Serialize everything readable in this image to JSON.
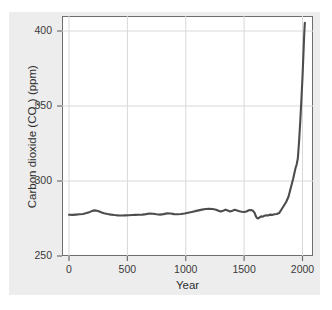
{
  "figure": {
    "cropped_header_text": "",
    "panel_color": "#ededed",
    "plot_background": "#ffffff",
    "frame_color": "#6e6e6e",
    "grid_color": "#d8d8d8",
    "line_color": "#4d4d4d"
  },
  "chart_data": {
    "type": "line",
    "title": "",
    "xlabel": "Year",
    "ylabel": "Carbon dioxide (CO2) (ppm)",
    "ylabel_parts": {
      "pre": "Carbon dioxide (CO",
      "sub": "2",
      "post": ") (ppm)"
    },
    "xlim": [
      -60,
      2090
    ],
    "ylim": [
      250,
      410
    ],
    "xticks": [
      0,
      500,
      1000,
      1500,
      2000
    ],
    "xtick_labels": [
      "0",
      "500",
      "1000",
      "1500",
      "2000"
    ],
    "yticks": [
      250,
      300,
      350,
      400
    ],
    "ytick_labels": [
      "250",
      "300",
      "350",
      "400"
    ],
    "grid": "both-light",
    "legend": "none",
    "series": [
      {
        "name": "Atmospheric CO2 concentration",
        "color": "#4d4d4d",
        "x": [
          0,
          30,
          60,
          90,
          120,
          150,
          180,
          200,
          220,
          240,
          260,
          280,
          300,
          330,
          360,
          390,
          420,
          450,
          480,
          510,
          540,
          570,
          600,
          630,
          660,
          690,
          720,
          750,
          780,
          810,
          840,
          870,
          900,
          930,
          960,
          990,
          1020,
          1050,
          1080,
          1110,
          1140,
          1170,
          1200,
          1230,
          1260,
          1280,
          1300,
          1320,
          1340,
          1360,
          1380,
          1400,
          1420,
          1440,
          1460,
          1480,
          1500,
          1520,
          1540,
          1560,
          1575,
          1590,
          1600,
          1610,
          1620,
          1630,
          1645,
          1660,
          1675,
          1690,
          1705,
          1720,
          1740,
          1760,
          1780,
          1800,
          1820,
          1840,
          1860,
          1880,
          1900,
          1920,
          1940,
          1950,
          1960,
          1970,
          1980,
          1990,
          2000,
          2010,
          2015,
          2020
        ],
        "y": [
          277.5,
          277.4,
          277.6,
          277.8,
          278.0,
          278.6,
          279.4,
          280.1,
          280.4,
          280.2,
          279.6,
          279.0,
          278.5,
          278.0,
          277.6,
          277.3,
          277.1,
          277.0,
          277.1,
          277.2,
          277.3,
          277.4,
          277.5,
          277.6,
          277.9,
          278.3,
          278.2,
          277.8,
          277.6,
          277.9,
          278.4,
          278.3,
          277.9,
          277.8,
          278.0,
          278.3,
          278.8,
          279.3,
          279.9,
          280.4,
          280.9,
          281.3,
          281.5,
          281.3,
          280.8,
          280.2,
          279.6,
          280.1,
          280.9,
          280.3,
          279.7,
          280.2,
          280.8,
          280.3,
          279.8,
          279.5,
          279.3,
          279.7,
          280.5,
          280.6,
          280.2,
          278.8,
          276.6,
          275.3,
          275.0,
          275.6,
          276.4,
          276.2,
          276.9,
          277.2,
          277.0,
          277.6,
          277.4,
          277.8,
          278.0,
          278.6,
          281.0,
          283.5,
          286.0,
          289.5,
          295.5,
          301.5,
          308.5,
          311.0,
          315.0,
          325.5,
          338.5,
          353.5,
          369.0,
          388.5,
          398.0,
          405.5
        ]
      }
    ],
    "annotations": []
  }
}
